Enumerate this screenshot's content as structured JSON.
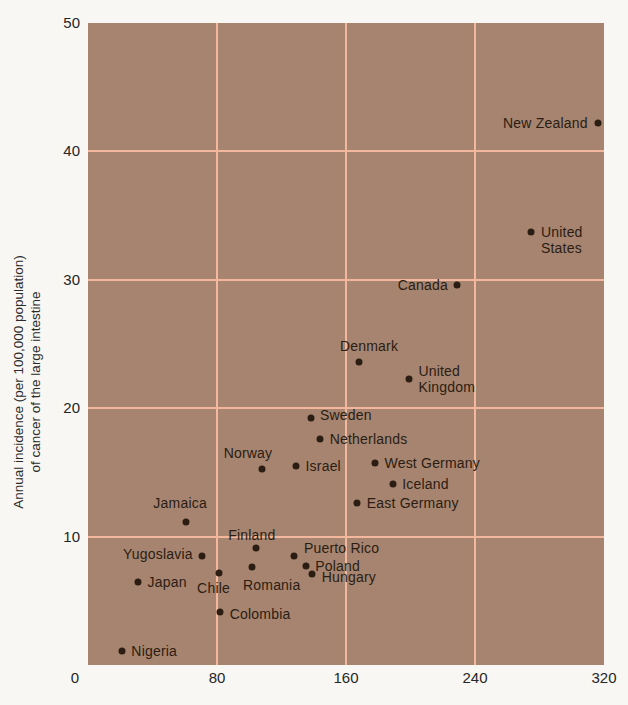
{
  "colors": {
    "page_bg": "#f8f7f3",
    "plot_bg": "#a68470",
    "gridline": "#f2b79d",
    "ink": "#2b1d12"
  },
  "chart_data": {
    "type": "scatter",
    "title": "",
    "ylabel_lines": [
      "Annual incidence (per 100,000 population)",
      "of cancer of the large intestine"
    ],
    "xlabel": "",
    "xlim": [
      0,
      320
    ],
    "ylim": [
      0,
      50
    ],
    "xticks": [
      0,
      80,
      160,
      240,
      320
    ],
    "yticks": [
      50,
      40,
      30,
      20,
      10
    ],
    "grid_x": [
      80,
      160,
      240
    ],
    "grid_y": [
      10,
      20,
      30,
      40
    ],
    "grid_on": true,
    "points": [
      {
        "label": "New Zealand",
        "x": 316,
        "y": 42.2,
        "pos": "left"
      },
      {
        "label": "United States",
        "lines": [
          "United",
          "States"
        ],
        "x": 275,
        "y": 33.7,
        "pos": "right",
        "dy": 8
      },
      {
        "label": "Canada",
        "x": 229,
        "y": 29.6,
        "pos": "left"
      },
      {
        "label": "Denmark",
        "x": 168,
        "y": 23.6,
        "pos": "above",
        "dx": 10
      },
      {
        "label": "United Kingdom",
        "lines": [
          "United",
          "Kingdom"
        ],
        "x": 199,
        "y": 22.3,
        "pos": "right"
      },
      {
        "label": "Sweden",
        "x": 138,
        "y": 19.2,
        "pos": "right",
        "dy": -3
      },
      {
        "label": "Netherlands",
        "x": 144,
        "y": 17.6,
        "pos": "right"
      },
      {
        "label": "Norway",
        "x": 108,
        "y": 15.3,
        "pos": "above",
        "dx": -14
      },
      {
        "label": "Israel",
        "x": 129,
        "y": 15.5,
        "pos": "right"
      },
      {
        "label": "West Germany",
        "x": 178,
        "y": 15.7,
        "pos": "right"
      },
      {
        "label": "Iceland",
        "x": 189,
        "y": 14.1,
        "pos": "right"
      },
      {
        "label": "East Germany",
        "x": 167,
        "y": 12.6,
        "pos": "right"
      },
      {
        "label": "Jamaica",
        "x": 61,
        "y": 11.1,
        "pos": "above",
        "dx": -6,
        "dy": -4
      },
      {
        "label": "Finland",
        "x": 104,
        "y": 9.1,
        "pos": "above",
        "dx": -4,
        "dy": 2
      },
      {
        "label": "Yugoslavia",
        "x": 71,
        "y": 8.5,
        "pos": "left",
        "dy": -2
      },
      {
        "label": "Puerto Rico",
        "x": 128,
        "y": 8.5,
        "pos": "right",
        "dy": -8
      },
      {
        "label": "Poland",
        "x": 135,
        "y": 7.7,
        "pos": "right"
      },
      {
        "label": "Romania",
        "x": 102,
        "y": 7.6,
        "pos": "below",
        "dx": 19,
        "dy": 2
      },
      {
        "label": "Chile",
        "x": 81,
        "y": 7.2,
        "pos": "below",
        "dx": -5
      },
      {
        "label": "Hungary",
        "x": 139,
        "y": 7.1,
        "pos": "right",
        "dy": 3
      },
      {
        "label": "Japan",
        "x": 31,
        "y": 6.5,
        "pos": "right"
      },
      {
        "label": "Colombia",
        "x": 82,
        "y": 4.1,
        "pos": "right",
        "dy": 2
      },
      {
        "label": "Nigeria",
        "x": 21,
        "y": 1.1,
        "pos": "right"
      }
    ]
  }
}
